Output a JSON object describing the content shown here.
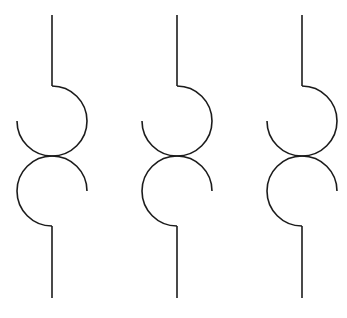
{
  "diagram": {
    "canvas": {
      "width": 347,
      "height": 318,
      "background": "#ffffff"
    },
    "stroke": {
      "color": "#1c1c1c",
      "width": 1.6
    },
    "radius": 35,
    "top_lead": {
      "y_start": 15,
      "y_end": 86
    },
    "bottom_lead": {
      "y_start": 226,
      "y_end": 298
    },
    "upper_coil_center_y": 121,
    "lower_coil_center_y": 191,
    "symbols": [
      {
        "id": "symbol-1",
        "x": 52
      },
      {
        "id": "symbol-2",
        "x": 177
      },
      {
        "id": "symbol-3",
        "x": 302
      }
    ]
  }
}
